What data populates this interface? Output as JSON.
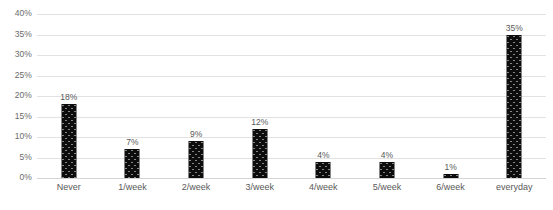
{
  "chart_data": {
    "type": "bar",
    "title": "",
    "subtitle": "",
    "xlabel": "",
    "ylabel": "",
    "categories": [
      "Never",
      "1/week",
      "2/week",
      "3/week",
      "4/week",
      "5/week",
      "6/week",
      "everyday"
    ],
    "values": [
      18,
      7,
      9,
      12,
      4,
      4,
      1,
      35
    ],
    "value_labels": [
      "18%",
      "7%",
      "9%",
      "12%",
      "4%",
      "4%",
      "1%",
      "35%"
    ],
    "ylim": [
      0,
      40
    ],
    "ytick_step": 5,
    "ytick_labels": [
      "0%",
      "5%",
      "10%",
      "15%",
      "20%",
      "25%",
      "30%",
      "35%",
      "40%"
    ],
    "ytick_values": [
      0,
      5,
      10,
      15,
      20,
      25,
      30,
      35,
      40
    ],
    "grid": true,
    "grid_axis": "y",
    "legend": false,
    "legend_position": "none",
    "bar_color": "#0d0d0d",
    "bar_pattern": "dotted",
    "grid_color": "#e2e2e2",
    "background_color": "#ffffff",
    "text_color": "#595959"
  }
}
